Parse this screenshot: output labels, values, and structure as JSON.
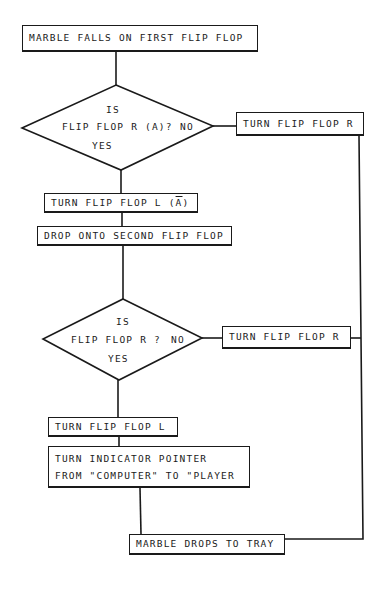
{
  "diagram": {
    "type": "flowchart",
    "nodes": [
      {
        "id": "start",
        "shape": "process",
        "label": "MARBLE FALLS ON FIRST FLIP FLOP"
      },
      {
        "id": "decision1",
        "shape": "decision",
        "line1": "IS",
        "line2": "FLIP FLOP R (A)?",
        "no_label": "NO",
        "yes_label": "YES"
      },
      {
        "id": "turn_r_1",
        "shape": "process",
        "label": "TURN FLIP FLOP R"
      },
      {
        "id": "turn_l_abar",
        "shape": "process",
        "label_prefix": "TURN FLIP FLOP L (",
        "label_overline": "A",
        "label_suffix": ")"
      },
      {
        "id": "drop_second",
        "shape": "process",
        "label": "DROP ONTO SECOND FLIP FLOP"
      },
      {
        "id": "decision2",
        "shape": "decision",
        "line1": "IS",
        "line2": "FLIP FLOP R ?",
        "no_label": "NO",
        "yes_label": "YES"
      },
      {
        "id": "turn_r_2",
        "shape": "process",
        "label": "TURN FLIP FLOP R"
      },
      {
        "id": "turn_l",
        "shape": "process",
        "label": "TURN FLIP FLOP L"
      },
      {
        "id": "indicator",
        "shape": "process",
        "line1": "TURN INDICATOR POINTER",
        "line2": "FROM \"COMPUTER\" TO \"PLAYER"
      },
      {
        "id": "end",
        "shape": "process",
        "label": "MARBLE DROPS TO TRAY"
      }
    ],
    "edges": [
      {
        "from": "start",
        "to": "decision1"
      },
      {
        "from": "decision1",
        "to": "turn_r_1",
        "label": "NO"
      },
      {
        "from": "decision1",
        "to": "turn_l_abar",
        "label": "YES"
      },
      {
        "from": "turn_l_abar",
        "to": "drop_second"
      },
      {
        "from": "drop_second",
        "to": "decision2"
      },
      {
        "from": "decision2",
        "to": "turn_r_2",
        "label": "NO"
      },
      {
        "from": "decision2",
        "to": "turn_l",
        "label": "YES"
      },
      {
        "from": "turn_l",
        "to": "indicator"
      },
      {
        "from": "indicator",
        "to": "end"
      },
      {
        "from": "turn_r_1",
        "to": "end"
      },
      {
        "from": "turn_r_2",
        "to": "end"
      }
    ]
  }
}
